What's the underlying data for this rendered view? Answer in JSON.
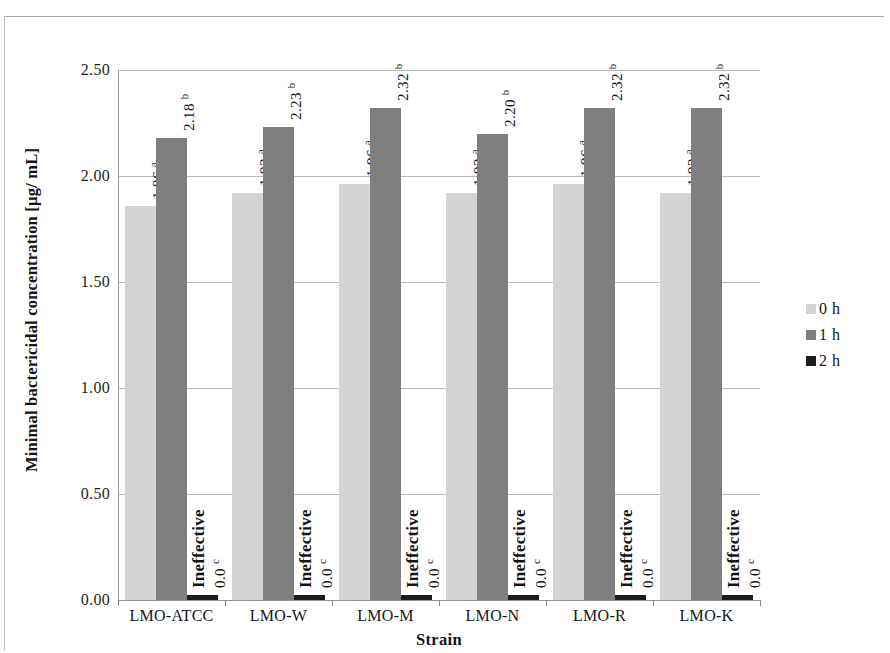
{
  "chart_data": {
    "type": "bar",
    "title": "",
    "xlabel": "Strain",
    "ylabel": "Minimal bactericidal concentration [µg/ mL]",
    "categories": [
      "LMO-ATCC",
      "LMO-W",
      "LMO-M",
      "LMO-N",
      "LMO-R",
      "LMO-K"
    ],
    "ylim": [
      0.0,
      2.5
    ],
    "yticks": [
      "0.00",
      "0.50",
      "1.00",
      "1.50",
      "2.00",
      "2.50"
    ],
    "ytick_values": [
      0.0,
      0.5,
      1.0,
      1.5,
      2.0,
      2.5
    ],
    "grid": true,
    "legend_position": "right",
    "series": [
      {
        "name": "0 h",
        "color": "#d4d4d4",
        "values": [
          1.86,
          1.92,
          1.96,
          1.92,
          1.96,
          1.92
        ],
        "labels": [
          "1.86",
          "1.92",
          "1.96",
          "1.92",
          "1.96",
          "1.92"
        ],
        "significance": [
          "a",
          "a",
          "a",
          "a",
          "a",
          "a"
        ]
      },
      {
        "name": "1 h",
        "color": "#7f7f7f",
        "values": [
          2.18,
          2.23,
          2.32,
          2.2,
          2.32,
          2.32
        ],
        "labels": [
          "2.18",
          "2.23",
          "2.32",
          "2.20",
          "2.32",
          "2.32"
        ],
        "significance": [
          "b",
          "b",
          "b",
          "b",
          "b",
          "b"
        ]
      },
      {
        "name": "2 h",
        "color": "#1c1c1c",
        "values": [
          0.0,
          0.0,
          0.0,
          0.0,
          0.0,
          0.0
        ],
        "labels": [
          "0.0",
          "0.0",
          "0.0",
          "0.0",
          "0.0",
          "0.0"
        ],
        "significance": [
          "c",
          "c",
          "c",
          "c",
          "c",
          "c"
        ],
        "annotation": "Ineffective",
        "annotations": [
          "Ineffective",
          "Ineffective",
          "Ineffective",
          "Ineffective",
          "Ineffective",
          "Ineffective"
        ]
      }
    ]
  },
  "legend": {
    "items": [
      {
        "label": "0 h",
        "color": "#d4d4d4"
      },
      {
        "label": "1 h",
        "color": "#7f7f7f"
      },
      {
        "label": "2 h",
        "color": "#1c1c1c"
      }
    ]
  },
  "axes": {
    "y_title": "Minimal bactericidal concentration [µg/ mL]",
    "x_title": "Strain"
  }
}
